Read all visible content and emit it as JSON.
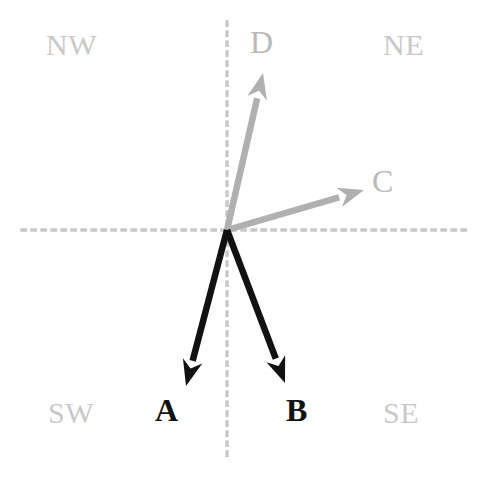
{
  "figure": {
    "width": 488,
    "height": 483,
    "background_color": "#ffffff"
  },
  "colors": {
    "axis_dot": "#c8c8c8",
    "vector_dark": "#111111",
    "vector_light": "#b0b0b0",
    "label_light": "#c9c9c9",
    "label_dark": "#111111"
  },
  "axes": {
    "origin": {
      "x": 227,
      "y": 230
    },
    "horizontal": {
      "y": 230,
      "x_start": 22,
      "x_end": 470,
      "style": "dotted"
    },
    "vertical": {
      "x": 227,
      "y_start": 22,
      "y_end": 460,
      "style": "dotted"
    }
  },
  "quadrants": [
    {
      "id": "nw",
      "label": "NW"
    },
    {
      "id": "ne",
      "label": "NE"
    },
    {
      "id": "sw",
      "label": "SW"
    },
    {
      "id": "se",
      "label": "SE"
    }
  ],
  "vectors": [
    {
      "id": "a",
      "label": "A",
      "color": "#111111",
      "tone": "dark",
      "start": {
        "x": 227,
        "y": 230
      },
      "end": {
        "x": 186,
        "y": 386
      },
      "quadrant": "SW"
    },
    {
      "id": "b",
      "label": "B",
      "color": "#111111",
      "tone": "dark",
      "start": {
        "x": 227,
        "y": 230
      },
      "end": {
        "x": 285,
        "y": 383
      },
      "quadrant": "SE"
    },
    {
      "id": "c",
      "label": "C",
      "color": "#b0b0b0",
      "tone": "light",
      "start": {
        "x": 227,
        "y": 230
      },
      "end": {
        "x": 364,
        "y": 190
      },
      "quadrant": "NE"
    },
    {
      "id": "d",
      "label": "D",
      "color": "#b0b0b0",
      "tone": "light",
      "start": {
        "x": 227,
        "y": 230
      },
      "end": {
        "x": 263,
        "y": 73
      },
      "quadrant": "NE"
    }
  ]
}
